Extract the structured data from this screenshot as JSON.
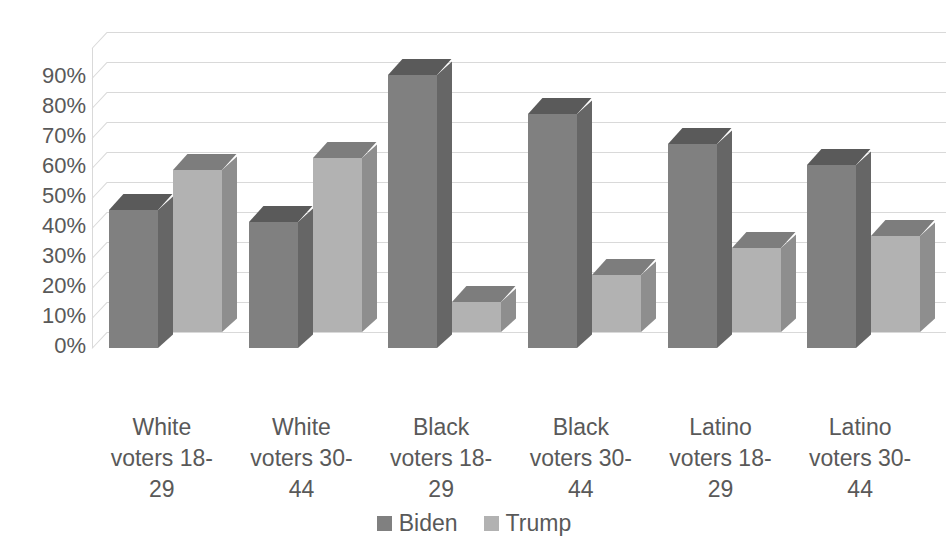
{
  "chart_data": {
    "type": "bar",
    "subtype": "clustered-column-3d",
    "title": "",
    "xlabel": "",
    "ylabel": "",
    "categories": [
      "White voters 18-29",
      "White voters 30-44",
      "Black voters 18-29",
      "Black voters 30-44",
      "Latino voters 18-29",
      "Latino voters 30-44"
    ],
    "category_lines": [
      [
        "White",
        "voters 18-",
        "29"
      ],
      [
        "White",
        "voters 30-",
        "44"
      ],
      [
        "Black",
        "voters 18-",
        "29"
      ],
      [
        "Black",
        "voters 30-",
        "44"
      ],
      [
        "Latino",
        "voters 18-",
        "29"
      ],
      [
        "Latino",
        "voters 30-",
        "44"
      ]
    ],
    "series": [
      {
        "name": "Biden",
        "color": "#808080",
        "values": [
          46,
          42,
          91,
          78,
          68,
          61
        ]
      },
      {
        "name": "Trump",
        "color": "#b2b2b2",
        "values": [
          54,
          58,
          10,
          19,
          28,
          32
        ]
      }
    ],
    "ylim": [
      0,
      100
    ],
    "ytick_values": [
      0,
      10,
      20,
      30,
      40,
      50,
      60,
      70,
      80,
      90
    ],
    "ytick_labels": [
      "0%",
      "10%",
      "20%",
      "30%",
      "40%",
      "50%",
      "60%",
      "70%",
      "80%",
      "90%"
    ],
    "yunit": "%",
    "grid": true,
    "grid_color": "#d9d9d9",
    "legend_position": "bottom",
    "background": "#ffffff",
    "text_color": "#595959"
  },
  "legend": {
    "items": [
      {
        "label": "Biden",
        "swatch_icon": "legend-swatch-icon",
        "color": "#808080"
      },
      {
        "label": "Trump",
        "swatch_icon": "legend-swatch-icon",
        "color": "#b2b2b2"
      }
    ]
  },
  "axis": {
    "y_labels": [
      "90%",
      "80%",
      "70%",
      "60%",
      "50%",
      "40%",
      "30%",
      "20%",
      "10%",
      "0%"
    ]
  }
}
